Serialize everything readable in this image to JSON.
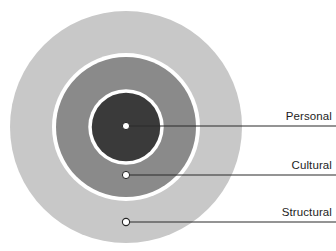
{
  "diagram": {
    "type": "concentric-circles",
    "title": "",
    "center": {
      "x": 126,
      "y": 127
    },
    "background_color": "#ffffff",
    "rings": [
      {
        "name": "structural",
        "label": "Structural",
        "radius": 116,
        "fill_color": "#c8c8c8",
        "stroke_color": "none",
        "level": 3,
        "marker": {
          "x": 126,
          "y": 222,
          "radius": 3.6,
          "fill": "#ffffff",
          "stroke": "#262626"
        },
        "leader_line": {
          "x1": 126,
          "y1": 222,
          "x2": 336,
          "y2": 222,
          "color": "#2b2b2b",
          "width": 1.2
        }
      },
      {
        "name": "cultural",
        "label": "Cultural",
        "radius": 72,
        "fill_color": "#8a8a8a",
        "stroke_color": "#ffffff",
        "stroke_width": 4,
        "level": 2,
        "marker": {
          "x": 126,
          "y": 175,
          "radius": 3.6,
          "fill": "#ffffff",
          "stroke": "#262626"
        },
        "leader_line": {
          "x1": 126,
          "y1": 175,
          "x2": 336,
          "y2": 175,
          "color": "#2b2b2b",
          "width": 1.2
        }
      },
      {
        "name": "personal",
        "label": "Personal",
        "radius": 36,
        "fill_color": "#3a3a3a",
        "stroke_color": "#ffffff",
        "stroke_width": 3.5,
        "level": 1,
        "marker": {
          "x": 126,
          "y": 126,
          "radius": 3.6,
          "fill": "#ffffff",
          "stroke": "#262626"
        },
        "leader_line": {
          "x1": 126,
          "y1": 126,
          "x2": 336,
          "y2": 126,
          "color": "#2b2b2b",
          "width": 1.2
        }
      }
    ],
    "labels": {
      "personal": "Personal",
      "cultural": "Cultural",
      "structural": "Structural"
    },
    "label_underlines": [
      {
        "name": "personal",
        "x1": 266,
        "y1": 126,
        "x2": 336,
        "y2": 126
      },
      {
        "name": "cultural",
        "x1": 266,
        "y1": 175,
        "x2": 336,
        "y2": 175
      },
      {
        "name": "structural",
        "x1": 266,
        "y1": 222,
        "x2": 336,
        "y2": 222
      }
    ]
  }
}
